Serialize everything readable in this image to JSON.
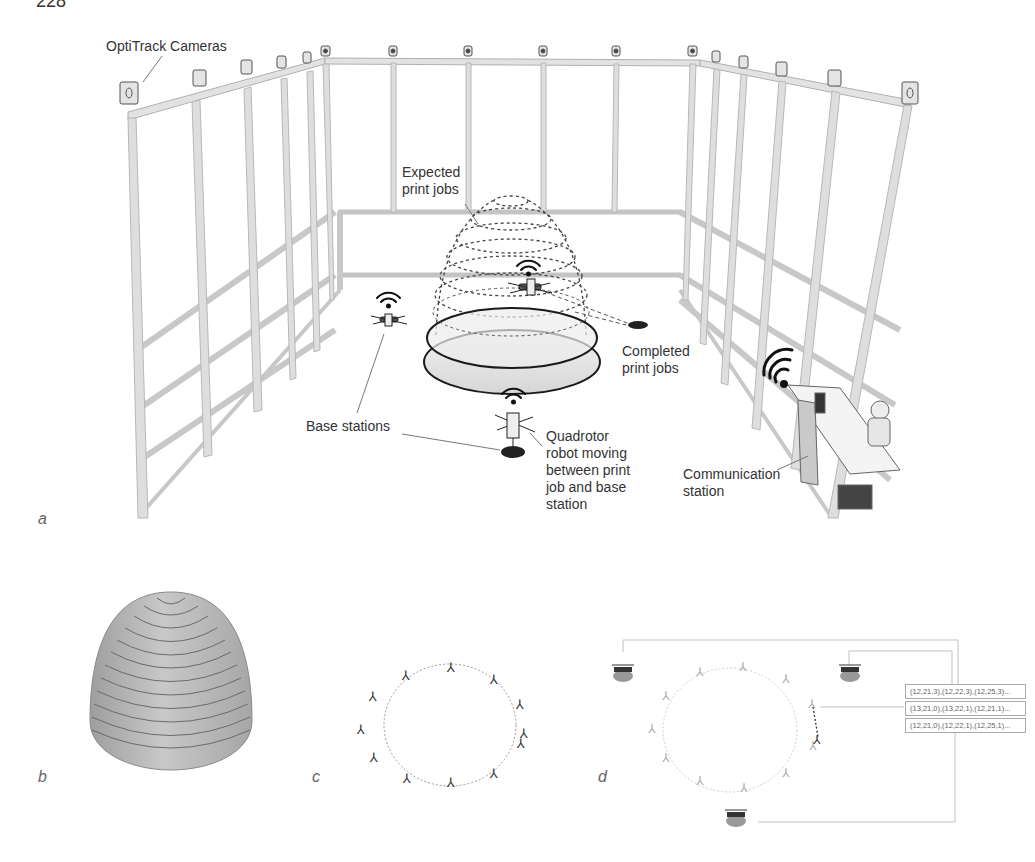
{
  "page_number": "228",
  "panel_a": {
    "letter": "a",
    "labels": {
      "cameras": "OptiTrack Cameras",
      "expected": "Expected\nprint jobs",
      "completed": "Completed\nprint jobs",
      "base_stations": "Base stations",
      "quadrotor": "Quadrotor\nrobot moving\nbetween print\njob and base\nstation",
      "communication": "Communication\nstation"
    }
  },
  "panel_b": {
    "letter": "b"
  },
  "panel_c": {
    "letter": "c"
  },
  "panel_d": {
    "letter": "d",
    "coord_boxes": [
      "(12,21,3),(12,22,3),(12,25,3)...",
      "(13,21,0),(13,22,1),(12,21,1)...",
      "(12,21,0),(12,22,1),(12,25,1)..."
    ]
  },
  "colors": {
    "frame": "#d9d9d9",
    "frame_edge": "#a8a8a8",
    "dome_fill": "#e8e8e8",
    "line_dark": "#222222",
    "leader": "#777777",
    "cone_fill": "#b5b5b5"
  }
}
